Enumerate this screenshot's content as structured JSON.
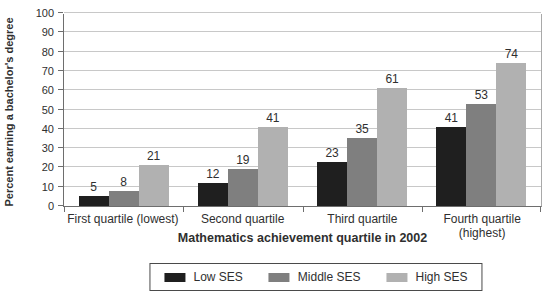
{
  "chart_data": {
    "type": "bar",
    "title": "",
    "categories": [
      "First quartile (lowest)",
      "Second quartile",
      "Third quartile",
      "Fourth quartile (highest)"
    ],
    "series": [
      {
        "name": "Low SES",
        "color": "#1f1f1f",
        "values": [
          5,
          12,
          23,
          41
        ]
      },
      {
        "name": "Middle SES",
        "color": "#7f7f7f",
        "values": [
          8,
          19,
          35,
          53
        ]
      },
      {
        "name": "High SES",
        "color": "#b1b1b1",
        "values": [
          21,
          41,
          61,
          74
        ]
      }
    ],
    "xlabel": "Mathematics achievement quartile in 2002",
    "ylabel": "Percent earning a bachelor's degree",
    "ylim": [
      0,
      100
    ],
    "ytick_step": 10,
    "grid": true,
    "value_labels": true,
    "legend_position": "bottom"
  },
  "colors": {
    "grid": "#c8c8c8",
    "axis": "#6e6e6e",
    "text": "#2f2f2f",
    "background": "#ffffff"
  }
}
